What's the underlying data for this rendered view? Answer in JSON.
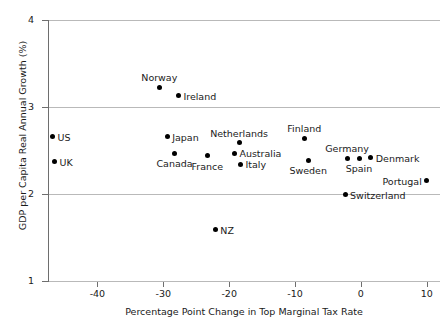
{
  "chart_data": {
    "type": "scatter",
    "title": "",
    "xlabel": "Percentage Point Change in Top Marginal Tax Rate",
    "ylabel": "GDP per Capita Real Annual Growth (%)",
    "xlim": [
      -47.5,
      12
    ],
    "ylim": [
      1,
      4
    ],
    "xticks": [
      -40,
      -30,
      -20,
      -10,
      0,
      10
    ],
    "xtick_labels": [
      "-40",
      "-30",
      "-20",
      "-10",
      "0",
      "10"
    ],
    "yticks": [
      1,
      2,
      3,
      4
    ],
    "ytick_labels": [
      "1",
      "2",
      "3",
      "4"
    ],
    "grid": "horizontal",
    "legend": "none",
    "marker_color": "#000000",
    "grid_color": "#b9b9b9",
    "axis_color": "#6e6e6e",
    "points": [
      {
        "label": "US",
        "x": -46.8,
        "y": 2.66,
        "label_pos": "right"
      },
      {
        "label": "UK",
        "x": -46.5,
        "y": 2.37,
        "label_pos": "right"
      },
      {
        "label": "Norway",
        "x": -30.6,
        "y": 3.23,
        "label_pos": "above"
      },
      {
        "label": "Ireland",
        "x": -27.7,
        "y": 3.13,
        "label_pos": "right"
      },
      {
        "label": "Japan",
        "x": -29.4,
        "y": 2.66,
        "label_pos": "right"
      },
      {
        "label": "Canada",
        "x": -28.3,
        "y": 2.47,
        "label_pos": "below"
      },
      {
        "label": "France",
        "x": -23.3,
        "y": 2.44,
        "label_pos": "below"
      },
      {
        "label": "NZ",
        "x": -22.1,
        "y": 1.59,
        "label_pos": "right"
      },
      {
        "label": "Netherlands",
        "x": -18.5,
        "y": 2.59,
        "label_pos": "above"
      },
      {
        "label": "Australia",
        "x": -19.2,
        "y": 2.47,
        "label_pos": "right"
      },
      {
        "label": "Italy",
        "x": -18.3,
        "y": 2.34,
        "label_pos": "right"
      },
      {
        "label": "Finland",
        "x": -8.6,
        "y": 2.64,
        "label_pos": "above"
      },
      {
        "label": "Sweden",
        "x": -8.0,
        "y": 2.39,
        "label_pos": "below"
      },
      {
        "label": "Germany",
        "x": -2.1,
        "y": 2.41,
        "label_pos": "above"
      },
      {
        "label": "Spain",
        "x": -0.3,
        "y": 2.41,
        "label_pos": "below"
      },
      {
        "label": "Denmark",
        "x": 1.5,
        "y": 2.42,
        "label_pos": "right"
      },
      {
        "label": "Portugal",
        "x": 10.0,
        "y": 2.15,
        "label_pos": "left"
      },
      {
        "label": "Switzerland",
        "x": -2.4,
        "y": 1.99,
        "label_pos": "right"
      }
    ]
  }
}
